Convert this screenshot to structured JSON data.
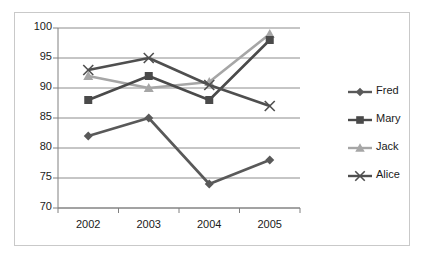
{
  "chart_data": {
    "type": "line",
    "title": "",
    "xlabel": "",
    "ylabel": "",
    "categories": [
      "2002",
      "2003",
      "2004",
      "2005"
    ],
    "ylim": [
      70,
      100
    ],
    "ytick_labels": [
      "100",
      "95",
      "90",
      "85",
      "80",
      "75",
      "70"
    ],
    "ytick_values": [
      100,
      95,
      90,
      85,
      80,
      75,
      70
    ],
    "grid": "horizontal",
    "legend_position": "right",
    "series": [
      {
        "name": "Fred",
        "marker": "diamond",
        "color": "#595959",
        "values": [
          82,
          85,
          74,
          78
        ]
      },
      {
        "name": "Mary",
        "marker": "square",
        "color": "#4a4a4a",
        "values": [
          88,
          92,
          88,
          98
        ]
      },
      {
        "name": "Jack",
        "marker": "triangle",
        "color": "#a6a6a6",
        "values": [
          92,
          90,
          91,
          99
        ]
      },
      {
        "name": "Alice",
        "marker": "cross",
        "color": "#4f4f4f",
        "values": [
          93,
          95,
          90.5,
          87
        ]
      }
    ]
  },
  "legend": {
    "items": [
      {
        "label": "Fred"
      },
      {
        "label": "Mary"
      },
      {
        "label": "Jack"
      },
      {
        "label": "Alice"
      }
    ]
  },
  "colors": {
    "frame_border": "#c9c9c9",
    "gridline": "#8c8c8c",
    "axis": "#808080",
    "text": "#1a1a1a",
    "plot_background": "#ffffff"
  }
}
